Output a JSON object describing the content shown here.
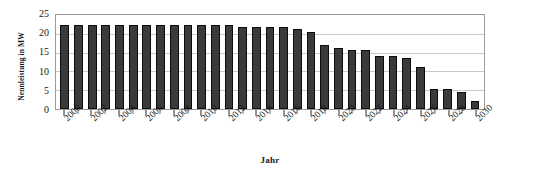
{
  "chart_data": {
    "type": "bar",
    "title": "",
    "xlabel": "Jahr",
    "ylabel": "Nennleistung in MW",
    "ylim": [
      0,
      25
    ],
    "yticks": [
      0,
      5,
      10,
      15,
      20,
      25
    ],
    "grid": true,
    "legend": null,
    "bar_color": "#3a3a3a",
    "bar_edge_color": "#0d0d0d",
    "plot_background": "#ffffff",
    "gridline_color": "#c9c9c9",
    "categories": [
      "2000",
      "2001",
      "2002",
      "2003",
      "2004",
      "2005",
      "2006",
      "2007",
      "2008",
      "2009",
      "2010",
      "2011",
      "2012",
      "2013",
      "2014",
      "2015",
      "2016",
      "2017",
      "2018",
      "2019",
      "2020",
      "2021",
      "2022",
      "2023",
      "2024",
      "2025",
      "2026",
      "2027",
      "2028",
      "2029",
      "2030"
    ],
    "tick_labels_shown": [
      "2000",
      "2002",
      "2004",
      "2006",
      "2008",
      "2010",
      "2012",
      "2014",
      "2016",
      "2018",
      "2020",
      "2022",
      "2024",
      "2026",
      "2028",
      "2030"
    ],
    "values": [
      22.3,
      22.3,
      22.3,
      22.3,
      22.3,
      22.3,
      22.3,
      22.3,
      22.3,
      22.3,
      22.3,
      22.3,
      22.3,
      21.9,
      21.9,
      21.9,
      21.9,
      21.2,
      20.6,
      17.0,
      16.2,
      15.6,
      15.6,
      14.2,
      14.2,
      13.6,
      11.3,
      5.2,
      5.2,
      4.5,
      2.0
    ]
  }
}
